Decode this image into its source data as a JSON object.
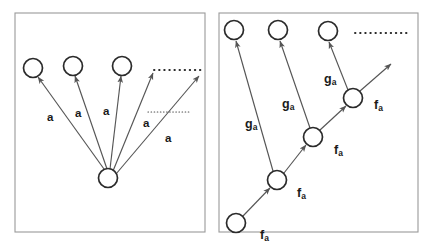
{
  "figure": {
    "colors": {
      "panel_border": "#9a9a9a",
      "node_stroke": "#2b2b2b",
      "node_fill": "#ffffff",
      "edge_stroke": "#555555",
      "dot_stroke": "#2b2b2b",
      "label_color": "#1a1a1a",
      "background": "#ffffff"
    }
  },
  "panels": [
    {
      "id": "left-panel",
      "name": "star-topology-panel",
      "frame": {
        "x": 15,
        "y": 13,
        "w": 190,
        "h": 219
      },
      "nodes": [
        {
          "id": "L-center",
          "name": "center-node",
          "cx": 108,
          "cy": 178,
          "r": 9.5
        },
        {
          "id": "L-top-1",
          "name": "target-node-1",
          "cx": 33,
          "cy": 68,
          "r": 9.5
        },
        {
          "id": "L-top-2",
          "name": "target-node-2",
          "cx": 73,
          "cy": 66,
          "r": 9.5
        },
        {
          "id": "L-top-3",
          "name": "target-node-3",
          "cx": 122,
          "cy": 66,
          "r": 9.5
        }
      ],
      "edges": [
        {
          "id": "L-e1",
          "name": "edge-a-1",
          "from": [
            104,
            169
          ],
          "to": [
            38,
            77
          ],
          "arrow": true
        },
        {
          "id": "L-e2",
          "name": "edge-a-2",
          "from": [
            107,
            169
          ],
          "to": [
            75,
            76
          ],
          "arrow": true
        },
        {
          "id": "L-e3",
          "name": "edge-a-3",
          "from": [
            110,
            169
          ],
          "to": [
            121,
            76
          ],
          "arrow": true
        },
        {
          "id": "L-e4",
          "name": "edge-a-4",
          "from": [
            113,
            171
          ],
          "to": [
            153,
            73
          ],
          "arrow": true
        },
        {
          "id": "L-e5",
          "name": "edge-a-5",
          "from": [
            116,
            174
          ],
          "to": [
            199,
            76
          ],
          "arrow": true
        }
      ],
      "dotted_lines": [
        {
          "id": "L-d1",
          "name": "ellipsis-dots-top",
          "from": [
            154,
            70
          ],
          "to": [
            201,
            70
          ]
        },
        {
          "id": "L-d2",
          "name": "ellipsis-dots-lower",
          "from": [
            148,
            112
          ],
          "to": [
            190,
            112
          ]
        }
      ],
      "labels": [
        {
          "id": "L-a1",
          "name": "edge-label-a-1",
          "text": "a",
          "x": 47,
          "y": 112
        },
        {
          "id": "L-a2",
          "name": "edge-label-a-2",
          "text": "a",
          "x": 75,
          "y": 108
        },
        {
          "id": "L-a3",
          "name": "edge-label-a-3",
          "text": "a",
          "x": 103,
          "y": 106
        },
        {
          "id": "L-a4",
          "name": "edge-label-a-4",
          "text": "a",
          "x": 143,
          "y": 118
        },
        {
          "id": "L-a5",
          "name": "edge-label-a-5",
          "text": "a",
          "x": 165,
          "y": 133
        }
      ]
    },
    {
      "id": "right-panel",
      "name": "chain-topology-panel",
      "frame": {
        "x": 219,
        "y": 13,
        "w": 199,
        "h": 219
      },
      "nodes": [
        {
          "id": "R-c0",
          "name": "chain-node-0",
          "cx": 236,
          "cy": 223,
          "r": 9.5
        },
        {
          "id": "R-c1",
          "name": "chain-node-1",
          "cx": 277,
          "cy": 180,
          "r": 9.5
        },
        {
          "id": "R-c2",
          "name": "chain-node-2",
          "cx": 313,
          "cy": 137,
          "r": 9.5
        },
        {
          "id": "R-c3",
          "name": "chain-node-3",
          "cx": 353,
          "cy": 98,
          "r": 9.5
        },
        {
          "id": "R-t1",
          "name": "target-node-1",
          "cx": 234,
          "cy": 30,
          "r": 9.5
        },
        {
          "id": "R-t2",
          "name": "target-node-2",
          "cx": 278,
          "cy": 30,
          "r": 9.5
        },
        {
          "id": "R-t3",
          "name": "target-node-3",
          "cx": 328,
          "cy": 31,
          "r": 9.5
        }
      ],
      "edges": [
        {
          "id": "R-f1",
          "name": "edge-fa-1",
          "from": [
            243,
            216
          ],
          "to": [
            270,
            188
          ],
          "arrow": true
        },
        {
          "id": "R-f2",
          "name": "edge-fa-2",
          "from": [
            284,
            173
          ],
          "to": [
            306,
            145
          ],
          "arrow": true
        },
        {
          "id": "R-f3",
          "name": "edge-fa-3",
          "from": [
            320,
            130
          ],
          "to": [
            346,
            106
          ],
          "arrow": true
        },
        {
          "id": "R-f4",
          "name": "edge-fa-4",
          "from": [
            360,
            91
          ],
          "to": [
            391,
            64
          ],
          "arrow": true
        },
        {
          "id": "R-g1",
          "name": "edge-ga-1",
          "from": [
            273,
            171
          ],
          "to": [
            236,
            41
          ],
          "arrow": true
        },
        {
          "id": "R-g2",
          "name": "edge-ga-2",
          "from": [
            310,
            128
          ],
          "to": [
            280,
            41
          ],
          "arrow": true
        },
        {
          "id": "R-g3",
          "name": "edge-ga-3",
          "from": [
            348,
            90
          ],
          "to": [
            329,
            42
          ],
          "arrow": true
        }
      ],
      "dotted_lines": [
        {
          "id": "R-d1",
          "name": "ellipsis-dots-top",
          "from": [
            355,
            33
          ],
          "to": [
            409,
            33
          ]
        }
      ],
      "labels": [
        {
          "id": "R-f1l",
          "name": "edge-label-fa-1",
          "text": "f",
          "sub": "a",
          "x": 260,
          "y": 229
        },
        {
          "id": "R-f2l",
          "name": "edge-label-fa-2",
          "text": "f",
          "sub": "a",
          "x": 297,
          "y": 187
        },
        {
          "id": "R-f3l",
          "name": "edge-label-fa-3",
          "text": "f",
          "sub": "a",
          "x": 334,
          "y": 144
        },
        {
          "id": "R-f4l",
          "name": "edge-label-fa-4",
          "text": "f",
          "sub": "a",
          "x": 374,
          "y": 99
        },
        {
          "id": "R-g1l",
          "name": "edge-label-ga-1",
          "text": "g",
          "sub": "a",
          "x": 245,
          "y": 118
        },
        {
          "id": "R-g2l",
          "name": "edge-label-ga-2",
          "text": "g",
          "sub": "a",
          "x": 282,
          "y": 98
        },
        {
          "id": "R-g3l",
          "name": "edge-label-ga-3",
          "text": "g",
          "sub": "a",
          "x": 324,
          "y": 73
        }
      ]
    }
  ]
}
